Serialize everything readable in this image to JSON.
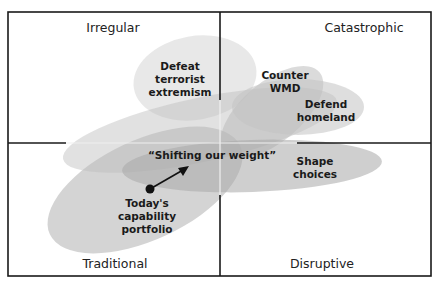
{
  "diagram": {
    "type": "quadrant-overlap",
    "quadrants": {
      "top_left": "Irregular",
      "top_right": "Catastrophic",
      "bottom_left": "Traditional",
      "bottom_right": "Disruptive"
    },
    "regions": [
      {
        "id": "defeat-terrorist-extremism",
        "lines": [
          "Defeat",
          "terrorist",
          "extremism"
        ]
      },
      {
        "id": "counter-wmd",
        "lines": [
          "Counter",
          "WMD"
        ]
      },
      {
        "id": "defend-homeland",
        "lines": [
          "Defend",
          "homeland"
        ]
      },
      {
        "id": "shape-choices",
        "lines": [
          "Shape",
          "choices"
        ]
      },
      {
        "id": "todays-capability-portfolio",
        "lines": [
          "Today's",
          "capability",
          "portfolio"
        ]
      }
    ],
    "arrow_label": "“Shifting our weight”",
    "colors": {
      "frame": "#1a1a1a",
      "region_fill": "#b4b4b4",
      "text": "#1a1a1a",
      "dot": "#111111"
    }
  }
}
